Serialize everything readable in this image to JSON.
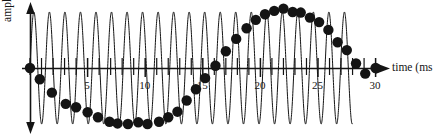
{
  "figure": {
    "background_color": "#ffffff",
    "ink_color": "#141414",
    "width": 439,
    "height": 136
  },
  "chart_data": {
    "type": "line",
    "title": "",
    "subtitle": "",
    "xlabel": "time (ms",
    "ylabel": "amplitude",
    "xlim": [
      -1.2,
      31.5
    ],
    "ylim": [
      -1.35,
      1.35
    ],
    "grid": false,
    "legend": null,
    "annotations": [],
    "axis": {
      "x_axis_arrow": true,
      "y_axis_arrow": "double",
      "x_tick_interval": 1,
      "x_tick_labels": [
        "5",
        "10",
        "15",
        "20",
        "25",
        "30"
      ],
      "x_tick_label_values": [
        5,
        10,
        15,
        20,
        25,
        30
      ],
      "x_tick_values": [
        0,
        1,
        2,
        3,
        4,
        5,
        6,
        7,
        8,
        9,
        10,
        11,
        12,
        13,
        14,
        15,
        16,
        17,
        18,
        19,
        20,
        21,
        22,
        23,
        24,
        25,
        26,
        27,
        28,
        29,
        30,
        31
      ],
      "y_tick_labels": [],
      "origin_x": 30,
      "axis_y": 68
    },
    "series": [
      {
        "name": "continuous signal",
        "kind": "line",
        "description": "high-frequency sine wave, constant amplitude",
        "color": "#141414",
        "line_width": 1,
        "frequency_cycles_per_ms": 0.7419,
        "amplitude": 1.0,
        "phase": 0.0,
        "t_start": 0.0,
        "t_end": 28.0
      },
      {
        "name": "sampled points",
        "kind": "scatter",
        "description": "sample dots tracing the slow aliased waveform",
        "color": "#141414",
        "marker": "filled-circle",
        "marker_size": 5.2,
        "t": [
          0.0,
          0.85,
          1.9,
          3.1,
          4.0,
          5.0,
          5.9,
          6.9,
          7.6,
          8.5,
          9.4,
          10.2,
          11.2,
          12.0,
          12.8,
          13.6,
          14.4,
          15.2,
          16.1,
          17.0,
          17.9,
          18.8,
          19.6,
          20.4,
          21.2,
          22.0,
          22.8,
          23.5,
          24.3,
          25.1,
          25.9,
          26.7,
          27.5,
          28.3,
          29.1,
          30.0
        ],
        "values": [
          0.0,
          -0.2,
          -0.44,
          -0.64,
          -0.7,
          -0.79,
          -0.88,
          -0.96,
          -0.99,
          -1.0,
          -0.97,
          -1.0,
          -0.96,
          -0.88,
          -0.78,
          -0.58,
          -0.38,
          -0.18,
          0.04,
          0.3,
          0.52,
          0.71,
          0.86,
          0.96,
          1.02,
          1.06,
          1.0,
          0.99,
          0.9,
          0.82,
          0.68,
          0.46,
          0.32,
          0.08,
          -0.1,
          0.0
        ]
      }
    ]
  }
}
